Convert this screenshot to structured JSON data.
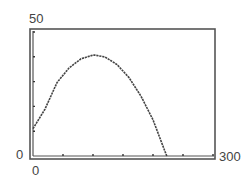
{
  "chart_data": {
    "type": "line",
    "title": "",
    "xlabel": "",
    "ylabel": "",
    "xlim": [
      0,
      300
    ],
    "ylim": [
      0,
      50
    ],
    "x_tick_step": 50,
    "y_tick_step": 10,
    "tick_labels": {
      "x_min": "0",
      "x_max": "300",
      "y_min": "0",
      "y_max": "50"
    },
    "grid": false,
    "legend": null,
    "series": [
      {
        "name": "curve",
        "x": [
          0,
          20,
          40,
          60,
          80,
          100,
          103,
          120,
          140,
          160,
          180,
          200,
          220,
          223
        ],
        "y": [
          11.0,
          18.9,
          29.6,
          35.5,
          39.2,
          40.7,
          40.7,
          39.9,
          36.9,
          31.6,
          24.1,
          14.6,
          1.8,
          0.0
        ]
      }
    ]
  },
  "labels": {
    "y_max": "50",
    "y_min": "0",
    "x_min": "0",
    "x_max": "300"
  }
}
